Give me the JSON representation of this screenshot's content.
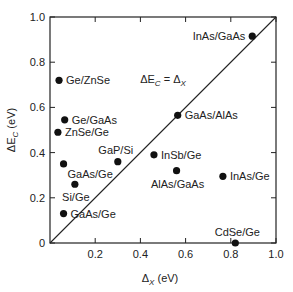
{
  "chart_data": {
    "type": "scatter",
    "title": "",
    "xlabel": "Δ_X (eV)",
    "ylabel": "ΔE_C (eV)",
    "xlim": [
      0,
      1.0
    ],
    "ylim": [
      0,
      1.0
    ],
    "grid": false,
    "legend": null,
    "x_ticks": [
      "0.2",
      "0.4",
      "0.6",
      "0.8",
      "1.0"
    ],
    "x_tick_values": [
      0.2,
      0.4,
      0.6,
      0.8,
      1.0
    ],
    "y_ticks": [
      "0",
      "0.2",
      "0.4",
      "0.6",
      "0.8",
      "1.0"
    ],
    "y_tick_values": [
      0,
      0.2,
      0.4,
      0.6,
      0.8,
      1.0
    ],
    "annotations": [
      {
        "text": "ΔE_C = Δ_X",
        "type": "reference-line",
        "x1": 0,
        "y1": 0,
        "x2": 1.0,
        "y2": 1.0
      }
    ],
    "points": [
      {
        "label": "InAs/GaAs",
        "x": 0.895,
        "y": 0.915,
        "label_side": "left"
      },
      {
        "label": "Ge/ZnSe",
        "x": 0.04,
        "y": 0.72,
        "label_side": "right"
      },
      {
        "label": "GaAs/AlAs",
        "x": 0.565,
        "y": 0.565,
        "label_side": "right"
      },
      {
        "label": "Ge/GaAs",
        "x": 0.065,
        "y": 0.545,
        "label_side": "right"
      },
      {
        "label": "ZnSe/Ge",
        "x": 0.035,
        "y": 0.49,
        "label_side": "right"
      },
      {
        "label": "InSb/Ge",
        "x": 0.46,
        "y": 0.39,
        "label_side": "right"
      },
      {
        "label": "GaP/Si",
        "x": 0.3,
        "y": 0.36,
        "label_side": "above-left"
      },
      {
        "label": "GaAs/Ge",
        "x": 0.06,
        "y": 0.35,
        "label_side": "below-right"
      },
      {
        "label": "AlAs/GaAs",
        "x": 0.56,
        "y": 0.32,
        "label_side": "below-left"
      },
      {
        "label": "InAs/Ge",
        "x": 0.765,
        "y": 0.295,
        "label_side": "right"
      },
      {
        "label": "Si/Ge",
        "x": 0.11,
        "y": 0.26,
        "label_side": "below-left"
      },
      {
        "label": "GaAs/Ge",
        "x": 0.06,
        "y": 0.13,
        "label_side": "right"
      },
      {
        "label": "CdSe/Ge",
        "x": 0.82,
        "y": 0.0,
        "label_side": "above"
      }
    ],
    "colors": {
      "marker": "#111111",
      "axis": "#222222",
      "line": "#222222"
    }
  }
}
